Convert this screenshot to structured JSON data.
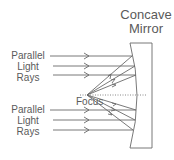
{
  "title": {
    "line1": "Concave",
    "line2": "Mirror"
  },
  "upper_label": {
    "line1": "Parallel",
    "line2": "Light",
    "line3": "Rays"
  },
  "lower_label": {
    "line1": "Parallel",
    "line2": "Light",
    "line3": "Rays"
  },
  "focus_label": "Focus",
  "colors": {
    "stroke": "#6a6a6a",
    "text": "#5a5a5a",
    "background": "#ffffff"
  }
}
